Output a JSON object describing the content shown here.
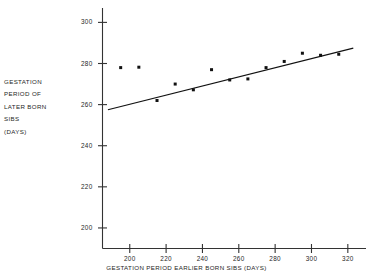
{
  "chart_data": {
    "type": "scatter",
    "title": "",
    "xlabel": "GESTATION PERIOD EARLIER BORN SIBS (DAYS)",
    "ylabel_lines": [
      "GESTATION",
      "PERIOD OF",
      "LATER BORN",
      "SIBS",
      "(DAYS)"
    ],
    "ylabel": "GESTATION PERIOD OF LATER BORN SIBS (DAYS)",
    "xlim": [
      185,
      330
    ],
    "ylim": [
      190,
      307
    ],
    "xticks": [
      200,
      220,
      240,
      260,
      280,
      300,
      320
    ],
    "xtick_labels": [
      "200",
      "220",
      "240",
      "260",
      "280",
      "300",
      "320"
    ],
    "yticks": [
      200,
      220,
      240,
      260,
      280,
      300
    ],
    "ytick_labels": [
      "200",
      "220",
      "240",
      "260",
      "280",
      "300"
    ],
    "grid": false,
    "legend": "none",
    "marker": "filled-square",
    "marker_color": "#111111",
    "line_color": "#111111",
    "axis_color": "#333333",
    "x": [
      195,
      205,
      215,
      225,
      235,
      245,
      255,
      265,
      275,
      285,
      295,
      305,
      315
    ],
    "y": [
      278,
      278.2,
      262,
      270,
      267.2,
      277,
      272,
      272.5,
      278,
      281,
      285,
      284,
      284.5
    ],
    "points": [
      {
        "x": 195,
        "y": 278
      },
      {
        "x": 205,
        "y": 278.2
      },
      {
        "x": 215,
        "y": 262
      },
      {
        "x": 225,
        "y": 270
      },
      {
        "x": 235,
        "y": 267.2
      },
      {
        "x": 245,
        "y": 277
      },
      {
        "x": 255,
        "y": 272
      },
      {
        "x": 265,
        "y": 272.5
      },
      {
        "x": 275,
        "y": 278
      },
      {
        "x": 285,
        "y": 281
      },
      {
        "x": 295,
        "y": 285
      },
      {
        "x": 305,
        "y": 284
      },
      {
        "x": 315,
        "y": 284.5
      }
    ],
    "fit_line": {
      "name": "regression-line",
      "x0": 188,
      "y0": 257.5,
      "x1": 323,
      "y1": 287.5
    }
  }
}
